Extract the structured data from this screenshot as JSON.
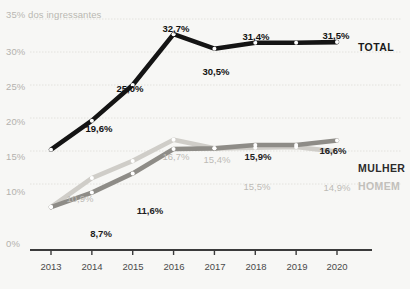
{
  "chart_data": {
    "type": "line",
    "title": "",
    "xlabel": "",
    "ylabel": "35% dos ingressantes",
    "axis_note": "35% dos ingressantes",
    "categories": [
      "2013",
      "2014",
      "2015",
      "2016",
      "2017",
      "2018",
      "2019",
      "2020"
    ],
    "x": [
      2013,
      2014,
      2015,
      2016,
      2017,
      2018,
      2019,
      2020
    ],
    "ylim": [
      0,
      35
    ],
    "yticks": [
      0,
      10,
      15,
      20,
      25,
      30,
      35
    ],
    "ytick_labels": [
      "0%",
      "10%",
      "15%",
      "20%",
      "25%",
      "30%",
      "35% dos ingressantes"
    ],
    "grid": true,
    "legend_position": "right-inline",
    "series": [
      {
        "name": "TOTAL",
        "color": "#141414",
        "values": [
          15.2,
          19.6,
          25.0,
          32.7,
          30.5,
          31.4,
          31.4,
          31.5
        ],
        "point_labels": [
          "",
          "19,6%",
          "25,0%",
          "32,7%",
          "30,5%",
          "31,4%",
          "",
          "31,5%"
        ]
      },
      {
        "name": "MULHER",
        "color": "#8e8c87",
        "values": [
          6.5,
          8.7,
          11.6,
          15.3,
          15.4,
          15.9,
          15.9,
          16.6
        ],
        "point_labels": [
          "",
          "8,7%",
          "11,6%",
          "",
          "",
          "15,9%",
          "",
          "16,6%"
        ]
      },
      {
        "name": "HOMEM",
        "color": "#cfcdc8",
        "values": [
          6.5,
          10.9,
          13.5,
          16.7,
          15.4,
          15.5,
          15.6,
          14.9
        ],
        "point_labels": [
          "",
          "10,9%",
          "",
          "16,7%",
          "15,4%",
          "15,5%",
          "",
          "14,9%"
        ]
      }
    ]
  },
  "axis": {
    "y_labels": [
      {
        "text": "35% dos ingressantes",
        "value": 35
      },
      {
        "text": "30%",
        "value": 30
      },
      {
        "text": "25%",
        "value": 25
      },
      {
        "text": "20%",
        "value": 20
      },
      {
        "text": "15%",
        "value": 15
      },
      {
        "text": "10%",
        "value": 10
      },
      {
        "text": "0%",
        "value": 0
      }
    ],
    "x_labels": [
      "2013",
      "2014",
      "2015",
      "2016",
      "2017",
      "2018",
      "2019",
      "2020"
    ]
  },
  "legend": {
    "total": "TOTAL",
    "mulher": "MULHER",
    "homem": "HOMEM"
  },
  "colors": {
    "total": "#141414",
    "mulher": "#8e8c87",
    "homem": "#cfcdc8",
    "background": "#f7f7f5",
    "grid": "#e3e2de",
    "axis": "#3b3b3b",
    "tick_text": "#b4b2ad"
  }
}
